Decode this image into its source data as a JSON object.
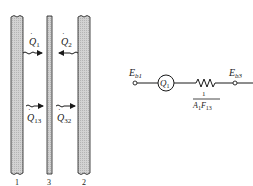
{
  "diagram": {
    "walls": [
      {
        "id": "1",
        "label": "1"
      },
      {
        "id": "3",
        "label": "3"
      },
      {
        "id": "2",
        "label": "2"
      }
    ],
    "fluxes": {
      "q1": {
        "symbol": "Q",
        "sub": "1"
      },
      "q2": {
        "symbol": "Q",
        "sub": "2"
      },
      "q13": {
        "symbol": "Q",
        "sub": "13"
      },
      "q32": {
        "symbol": "Q",
        "sub": "32"
      }
    },
    "network": {
      "node_left": {
        "symbol": "E",
        "sub": "b1"
      },
      "node_right": {
        "symbol": "E",
        "sub": "b3"
      },
      "source": {
        "symbol": "Q",
        "sub": "1"
      },
      "resistance": {
        "numerator": "1",
        "denom_a": "A",
        "denom_a_sub": "1",
        "denom_f": "F",
        "denom_f_sub": "13"
      }
    },
    "colors": {
      "wall_fill": "#c8c8c8",
      "stroke": "#1a1a1a"
    }
  }
}
